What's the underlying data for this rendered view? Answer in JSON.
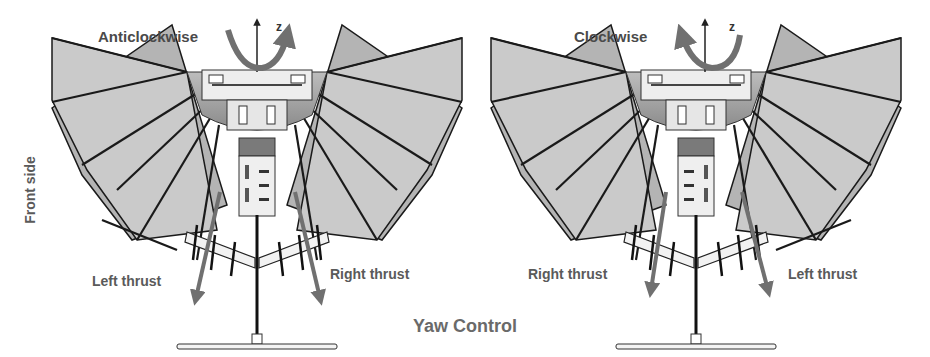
{
  "figure": {
    "caption": "Yaw Control",
    "side_label": "Front side",
    "left_panel": {
      "rotation_label": "Anticlockwise",
      "axis_label": "z",
      "thrust_left_label": "Left thrust",
      "thrust_right_label": "Right thrust"
    },
    "right_panel": {
      "rotation_label": "Clockwise",
      "axis_label": "z",
      "thrust_left_label": "Right thrust",
      "thrust_right_label": "Left thrust"
    },
    "colors": {
      "wing_fill": "#c8c8c8",
      "wing_rear_fill": "#b4b4b4",
      "spar": "#1a1a1a",
      "arrow": "#707070",
      "body_dark": "#7a7a7a",
      "text": "#5a5a5a"
    }
  }
}
